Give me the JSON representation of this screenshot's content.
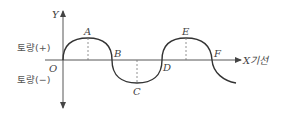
{
  "diagram": {
    "y_axis_label": "Y",
    "x_axis_label": "X기선",
    "origin_label": "O",
    "positive_label": "토량(+)",
    "negative_label": "토량(−)",
    "points": [
      {
        "name": "A",
        "role": "peak"
      },
      {
        "name": "B",
        "role": "zero-crossing"
      },
      {
        "name": "C",
        "role": "trough"
      },
      {
        "name": "D",
        "role": "zero-crossing"
      },
      {
        "name": "E",
        "role": "peak"
      },
      {
        "name": "F",
        "role": "zero-crossing"
      }
    ],
    "labels": {
      "A": "A",
      "B": "B",
      "C": "C",
      "D": "D",
      "E": "E",
      "F": "F"
    },
    "colors": {
      "curve": "#333333",
      "axis": "#444444",
      "dashed": "#777777"
    }
  }
}
